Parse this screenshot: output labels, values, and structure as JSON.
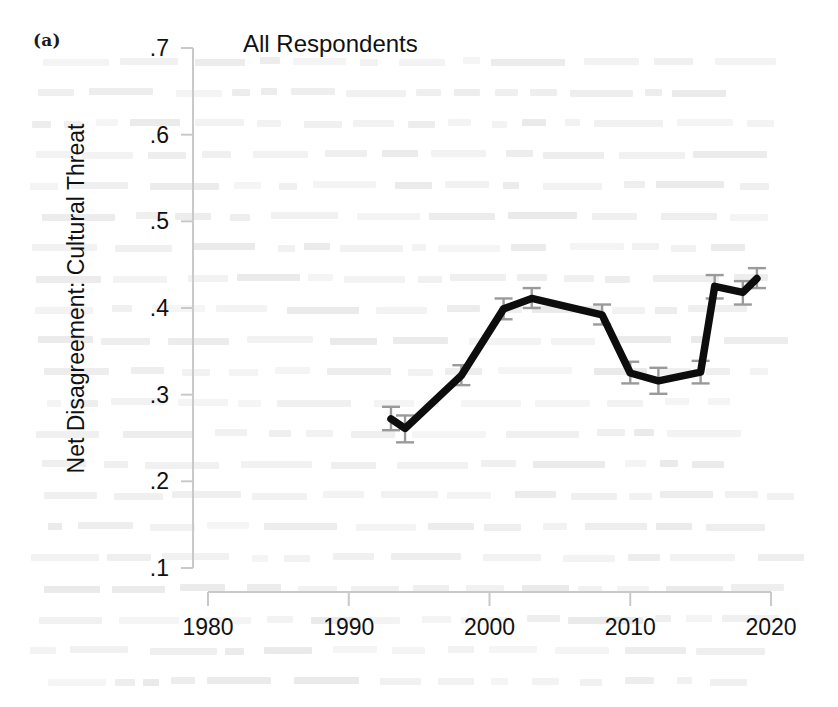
{
  "figure": {
    "panel_label": "(a)",
    "background": "#ffffff",
    "line_color": "#0d0d0d",
    "errorbar_color": "#9a9a9a",
    "axis_color": "#c9c9c9"
  },
  "chart_data": {
    "type": "line",
    "title": "All Respondents",
    "xlabel": "",
    "ylabel": "Net Disagreement: Cultural Threat",
    "xlim": [
      1977,
      2022
    ],
    "ylim": [
      0.1,
      0.7
    ],
    "grid": false,
    "legend": null,
    "xticks": [
      1980,
      1990,
      2000,
      2010,
      2020
    ],
    "xtick_labels": [
      "1980",
      "1990",
      "2000",
      "2010",
      "2020"
    ],
    "yticks": [
      0.1,
      0.2,
      0.3,
      0.4,
      0.5,
      0.6,
      0.7
    ],
    "ytick_labels": [
      ".1",
      ".2",
      ".3",
      ".4",
      ".5",
      ".6",
      ".7"
    ],
    "series": [
      {
        "name": "Net Disagreement: Cultural Threat",
        "x": [
          1993,
          1994,
          1998,
          2001,
          2003,
          2008,
          2010,
          2012,
          2015,
          2016,
          2018,
          2019
        ],
        "values": [
          0.272,
          0.261,
          0.322,
          0.399,
          0.411,
          0.392,
          0.325,
          0.316,
          0.326,
          0.425,
          0.418,
          0.434
        ],
        "error_low": [
          0.259,
          0.245,
          0.311,
          0.387,
          0.4,
          0.381,
          0.313,
          0.301,
          0.313,
          0.411,
          0.404,
          0.423
        ],
        "error_high": [
          0.286,
          0.276,
          0.334,
          0.411,
          0.423,
          0.404,
          0.338,
          0.331,
          0.339,
          0.438,
          0.431,
          0.446
        ]
      }
    ]
  },
  "ghost_text": {
    "description": "faint bleed-through text from reverse of scanned page"
  }
}
